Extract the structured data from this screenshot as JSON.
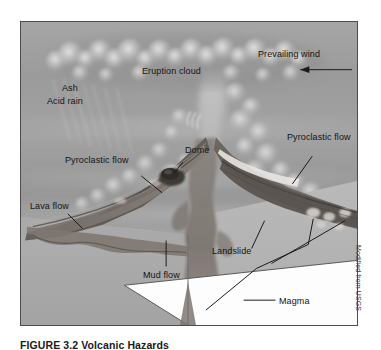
{
  "figure": {
    "credit": "Modified from USGS",
    "caption_number": "FIGURE 3.2",
    "caption_text": "Volcanic Hazards",
    "background_color": "#9a9a9a",
    "frame_color": "#4c4c4c"
  },
  "labels": {
    "prevailing_wind": "Prevailing wind",
    "eruption_cloud": "Eruption cloud",
    "ash": "Ash",
    "acid_rain": "Acid rain",
    "pyroclastic_flow_left": "Pyroclastic flow",
    "pyroclastic_flow_right": "Pyroclastic flow",
    "dome": "Dome",
    "lava_flow": "Lava flow",
    "mud_flow": "Mud flow",
    "landslide": "Landslide",
    "magma": "Magma"
  }
}
